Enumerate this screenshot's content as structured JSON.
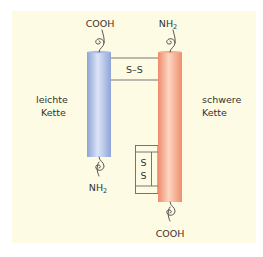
{
  "diagram": {
    "background_color": "#fdfbe3",
    "light_chain": {
      "label_line1": "leichte",
      "label_line2": "Kette",
      "color_light": "#c9d6f0",
      "color_dark": "#8ea3d6",
      "top_terminus": "COOH",
      "bottom_terminus_main": "NH",
      "bottom_terminus_sub": "2"
    },
    "heavy_chain": {
      "label_line1": "schwere",
      "label_line2": "Kette",
      "color_light": "#fcd2bd",
      "color_dark": "#ef8f70",
      "top_terminus_main": "NH",
      "top_terminus_sub": "2",
      "bottom_terminus": "COOH"
    },
    "interchain_bond": {
      "label": "S–S"
    },
    "intrachain_bond": {
      "label_top": "S",
      "label_bottom": "S"
    }
  }
}
